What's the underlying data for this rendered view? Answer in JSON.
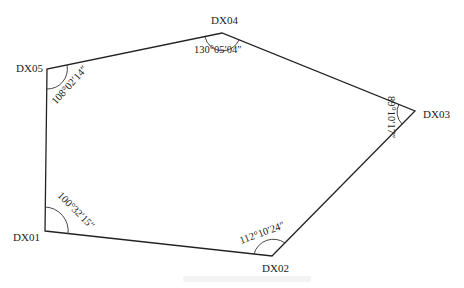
{
  "diagram": {
    "type": "traverse polygon",
    "vertices": [
      {
        "id": "DX01",
        "label": "DX01",
        "x": 45,
        "y": 231,
        "angle": "100°32′15″"
      },
      {
        "id": "DX02",
        "label": "DX02",
        "x": 272,
        "y": 256,
        "angle": "112°10′24″"
      },
      {
        "id": "DX03",
        "label": "DX03",
        "x": 415,
        "y": 111,
        "angle": "89°10′17″"
      },
      {
        "id": "DX04",
        "label": "DX04",
        "x": 222,
        "y": 33,
        "angle": "130°05′04″"
      },
      {
        "id": "DX05",
        "label": "DX05",
        "x": 47,
        "y": 69,
        "angle": "108°02′14″"
      }
    ],
    "edges": [
      [
        "DX01",
        "DX02"
      ],
      [
        "DX02",
        "DX03"
      ],
      [
        "DX03",
        "DX04"
      ],
      [
        "DX04",
        "DX05"
      ],
      [
        "DX05",
        "DX01"
      ]
    ],
    "line_color": "#222222"
  }
}
